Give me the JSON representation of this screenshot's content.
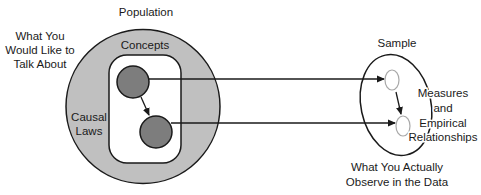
{
  "diagram": {
    "population": {
      "title": "Population",
      "outer_label": [
        "What You",
        "Would Like to",
        "Talk About"
      ],
      "concepts_label": "Concepts",
      "causal_laws_label": [
        "Causal",
        "Laws"
      ]
    },
    "sample": {
      "title": "Sample",
      "inner_label": [
        "Measures",
        "and",
        "Empirical",
        "Relationships"
      ],
      "bottom_label": [
        "What You Actually",
        "Observe in the Data"
      ]
    },
    "connections": [
      {
        "from": "concept-1",
        "to": "measure-1"
      },
      {
        "from": "concept-2",
        "to": "measure-2"
      },
      {
        "from": "concept-1",
        "to": "concept-2"
      },
      {
        "from": "measure-1",
        "to": "measure-2"
      }
    ],
    "colors": {
      "population_ring": "#c0c0c0",
      "concept_box": "#ffffff",
      "concept_node": "#7d7d7d",
      "outline": "#1a1a1a",
      "measure_node_outline": "#a8a8a8",
      "measure_node_fill": "#ffffff"
    }
  }
}
